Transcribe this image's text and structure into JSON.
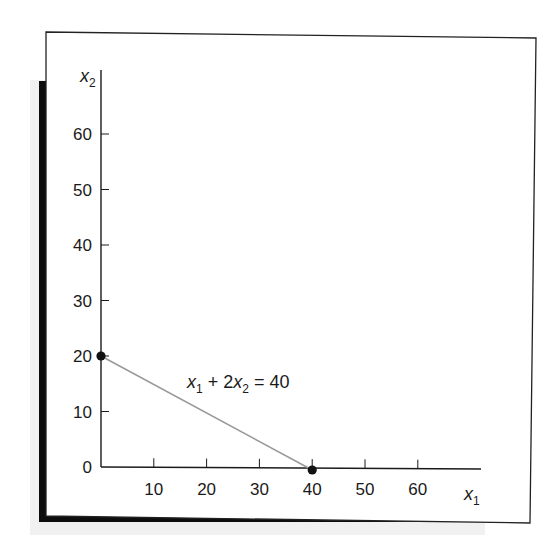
{
  "chart_data": {
    "type": "line",
    "title": "",
    "xlabel": "x",
    "xlabel_sub": "1",
    "ylabel": "x",
    "ylabel_sub": "2",
    "xlim": [
      0,
      68
    ],
    "ylim": [
      0,
      67
    ],
    "x_ticks": [
      10,
      20,
      30,
      40,
      50,
      60
    ],
    "y_ticks": [
      0,
      10,
      20,
      30,
      40,
      50,
      60
    ],
    "grid": false,
    "legend": null,
    "series": [
      {
        "name": "x1 + 2x2 = 40",
        "type": "line",
        "color": "#9a9a9a",
        "points": [
          [
            0,
            20
          ],
          [
            40,
            0
          ]
        ]
      }
    ],
    "markers": [
      {
        "x": 0,
        "y": 20,
        "color": "#111111"
      },
      {
        "x": 40,
        "y": 0,
        "color": "#111111"
      }
    ],
    "annotations": [
      {
        "text_parts": [
          {
            "t": "x",
            "italic": true
          },
          {
            "t": "1",
            "sub": true
          },
          {
            "t": " + 2",
            "italic": false
          },
          {
            "t": "x",
            "italic": true
          },
          {
            "t": "2",
            "sub": true
          },
          {
            "t": " = 40",
            "italic": false
          }
        ],
        "plain": "x1 + 2x2 = 40",
        "x": 16,
        "y": 16
      }
    ]
  },
  "colors": {
    "frame": "#222222",
    "shadow": "#0d0d0d",
    "axis": "#1a1a1a",
    "line": "#9a9a9a",
    "background": "#ffffff"
  }
}
